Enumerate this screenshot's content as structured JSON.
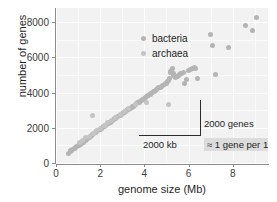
{
  "chart_data": {
    "type": "scatter",
    "title": "",
    "xlabel": "genome size (Mb)",
    "ylabel": "number of genes",
    "xlim": [
      0,
      9.6
    ],
    "ylim": [
      0,
      8800
    ],
    "xticks": [
      0,
      2,
      4,
      6,
      8
    ],
    "xticklabels": [
      "0",
      "2",
      "4",
      "6",
      "8"
    ],
    "yticks": [
      0,
      2000,
      4000,
      6000,
      8000
    ],
    "yticklabels": [
      "0",
      "2000",
      "4000",
      "6000",
      "8000"
    ],
    "grid": true,
    "legend_position": "upper-left-inside",
    "series": [
      {
        "name": "bacteria",
        "color": "#b4b4b4",
        "points": [
          [
            0.58,
            560
          ],
          [
            0.64,
            640
          ],
          [
            0.66,
            700
          ],
          [
            0.72,
            690
          ],
          [
            0.75,
            760
          ],
          [
            0.82,
            800
          ],
          [
            0.86,
            840
          ],
          [
            0.9,
            900
          ],
          [
            0.95,
            930
          ],
          [
            1.0,
            980
          ],
          [
            1.04,
            1000
          ],
          [
            1.11,
            1060
          ],
          [
            1.15,
            1110
          ],
          [
            1.2,
            1160
          ],
          [
            1.24,
            1190
          ],
          [
            1.3,
            1250
          ],
          [
            1.34,
            1300
          ],
          [
            1.38,
            1330
          ],
          [
            1.44,
            1380
          ],
          [
            1.5,
            1460
          ],
          [
            1.56,
            1510
          ],
          [
            1.6,
            1560
          ],
          [
            1.66,
            1600
          ],
          [
            1.72,
            1660
          ],
          [
            1.78,
            1720
          ],
          [
            1.84,
            1780
          ],
          [
            1.9,
            1830
          ],
          [
            1.95,
            1880
          ],
          [
            2.0,
            1930
          ],
          [
            2.05,
            1970
          ],
          [
            2.1,
            2020
          ],
          [
            2.16,
            2060
          ],
          [
            2.2,
            2100
          ],
          [
            2.26,
            2150
          ],
          [
            2.3,
            2190
          ],
          [
            2.36,
            2230
          ],
          [
            2.4,
            2280
          ],
          [
            2.46,
            2320
          ],
          [
            2.5,
            2360
          ],
          [
            2.56,
            2400
          ],
          [
            2.6,
            2450
          ],
          [
            2.66,
            2500
          ],
          [
            2.7,
            2540
          ],
          [
            2.76,
            2580
          ],
          [
            2.8,
            2630
          ],
          [
            2.86,
            2670
          ],
          [
            2.9,
            2720
          ],
          [
            2.96,
            2760
          ],
          [
            3.0,
            2800
          ],
          [
            3.06,
            2850
          ],
          [
            3.1,
            2890
          ],
          [
            3.16,
            2930
          ],
          [
            3.2,
            2980
          ],
          [
            3.26,
            3020
          ],
          [
            3.3,
            3060
          ],
          [
            3.36,
            3100
          ],
          [
            3.4,
            3150
          ],
          [
            3.46,
            3190
          ],
          [
            3.5,
            3230
          ],
          [
            3.56,
            3280
          ],
          [
            3.6,
            3320
          ],
          [
            3.66,
            3360
          ],
          [
            3.7,
            3410
          ],
          [
            3.76,
            3450
          ],
          [
            3.8,
            3500
          ],
          [
            3.86,
            3540
          ],
          [
            3.9,
            3590
          ],
          [
            3.96,
            3630
          ],
          [
            4.0,
            3680
          ],
          [
            4.06,
            3720
          ],
          [
            4.1,
            3770
          ],
          [
            4.16,
            3810
          ],
          [
            4.2,
            3860
          ],
          [
            4.26,
            3900
          ],
          [
            4.3,
            3950
          ],
          [
            4.36,
            3990
          ],
          [
            4.4,
            4040
          ],
          [
            4.46,
            4080
          ],
          [
            4.5,
            4120
          ],
          [
            4.56,
            4180
          ],
          [
            4.6,
            4220
          ],
          [
            4.66,
            4270
          ],
          [
            4.72,
            4310
          ],
          [
            4.78,
            4360
          ],
          [
            4.84,
            4400
          ],
          [
            4.9,
            4450
          ],
          [
            4.96,
            4490
          ],
          [
            5.0,
            4540
          ],
          [
            5.05,
            4600
          ],
          [
            5.1,
            4660
          ],
          [
            5.14,
            4780
          ],
          [
            5.18,
            5120
          ],
          [
            5.2,
            5200
          ],
          [
            5.24,
            5280
          ],
          [
            5.28,
            5340
          ],
          [
            5.3,
            5080
          ],
          [
            5.34,
            4960
          ],
          [
            5.38,
            4900
          ],
          [
            5.42,
            4840
          ],
          [
            5.5,
            4900
          ],
          [
            5.56,
            4960
          ],
          [
            5.6,
            5020
          ],
          [
            5.64,
            5060
          ],
          [
            5.7,
            5100
          ],
          [
            5.76,
            5160
          ],
          [
            5.8,
            4520
          ],
          [
            5.9,
            4760
          ],
          [
            6.0,
            5240
          ],
          [
            6.1,
            5300
          ],
          [
            6.2,
            5380
          ],
          [
            6.26,
            5420
          ],
          [
            6.3,
            5340
          ],
          [
            6.4,
            4820
          ],
          [
            7.0,
            7280
          ],
          [
            7.1,
            6680
          ],
          [
            7.2,
            5040
          ],
          [
            7.8,
            6560
          ],
          [
            8.6,
            7800
          ],
          [
            8.9,
            7500
          ],
          [
            9.1,
            8240
          ]
        ]
      },
      {
        "name": "archaea",
        "color": "#c4c4c4",
        "points": [
          [
            1.05,
            1180
          ],
          [
            1.2,
            1280
          ],
          [
            1.35,
            1420
          ],
          [
            1.5,
            1530
          ],
          [
            1.66,
            2700
          ],
          [
            1.7,
            1700
          ],
          [
            1.85,
            1820
          ],
          [
            2.0,
            1960
          ],
          [
            2.18,
            2140
          ],
          [
            2.35,
            2280
          ],
          [
            2.5,
            2400
          ],
          [
            2.7,
            2580
          ],
          [
            2.9,
            2740
          ],
          [
            3.1,
            2900
          ],
          [
            3.3,
            3080
          ],
          [
            3.6,
            3340
          ],
          [
            4.1,
            3440
          ],
          [
            5.1,
            3320
          ]
        ]
      }
    ],
    "annotations": {
      "rise_label": "2000 genes",
      "run_label": "2000 kb",
      "rate_label": "≈ 1 gene per 1000 bp",
      "triangle": {
        "x_start": 2.0,
        "x_end": 4.0,
        "y_start": 2000,
        "y_end": 4000
      }
    }
  },
  "legend": {
    "items": [
      {
        "label": "bacteria"
      },
      {
        "label": "archaea"
      }
    ]
  }
}
